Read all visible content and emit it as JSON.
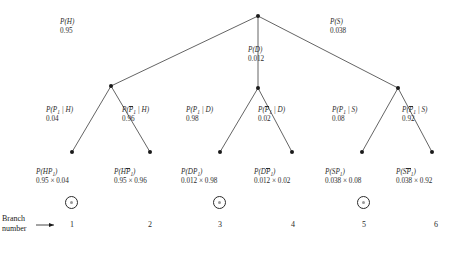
{
  "figure": {
    "type": "probability-tree-diagram",
    "caption": "",
    "branch_caption_line1": "Branch",
    "branch_caption_line2": "number"
  },
  "nodes": {
    "root": {
      "x": 258,
      "y": 16
    },
    "level1": [
      {
        "id": "H",
        "x": 111,
        "y": 86
      },
      {
        "id": "D",
        "x": 258,
        "y": 88
      },
      {
        "id": "S",
        "x": 398,
        "y": 88
      }
    ],
    "leaves": [
      {
        "x": 72,
        "y": 152
      },
      {
        "x": 150,
        "y": 152
      },
      {
        "x": 220,
        "y": 152
      },
      {
        "x": 292,
        "y": 152
      },
      {
        "x": 362,
        "y": 152
      },
      {
        "x": 432,
        "y": 152
      }
    ]
  },
  "level1_labels": [
    {
      "name": "P(H)",
      "symbol_html": "P(H)",
      "value": "0.95",
      "x": 60,
      "y": 18
    },
    {
      "name": "P(D)",
      "symbol_html": "P(D)",
      "value": "0.012",
      "x": 248,
      "y": 46
    },
    {
      "name": "P(S)",
      "symbol_html": "P(S)",
      "value": "0.038",
      "x": 330,
      "y": 18
    }
  ],
  "level2_labels": [
    {
      "name": "P(P1|H)",
      "value": "0.04",
      "x": 46,
      "y": 106
    },
    {
      "name": "P(P1bar|H)",
      "value": "0.96",
      "x": 122,
      "y": 106
    },
    {
      "name": "P(P1|D)",
      "value": "0.98",
      "x": 186,
      "y": 106
    },
    {
      "name": "P(P1bar|D)",
      "value": "0.02",
      "x": 258,
      "y": 106
    },
    {
      "name": "P(P1|S)",
      "value": "0.08",
      "x": 332,
      "y": 106
    },
    {
      "name": "P(P1bar|S)",
      "value": "0.92",
      "x": 402,
      "y": 106
    }
  ],
  "leaf_labels": [
    {
      "name": "P(HP1)",
      "value": "0.95 × 0.04",
      "x": 36,
      "y": 168
    },
    {
      "name": "P(HP1bar)",
      "value": "0.95 × 0.96",
      "x": 114,
      "y": 168
    },
    {
      "name": "P(DP1)",
      "value": "0.012 × 0.98",
      "x": 181,
      "y": 168
    },
    {
      "name": "P(DP1bar)",
      "value": "0.012 × 0.02",
      "x": 254,
      "y": 168
    },
    {
      "name": "P(SP1)",
      "value": "0.038 × 0.08",
      "x": 325,
      "y": 168
    },
    {
      "name": "P(SP1bar)",
      "value": "0.038 × 0.92",
      "x": 396,
      "y": 168
    }
  ],
  "branch_numbers": [
    {
      "label": "1",
      "x": 60
    },
    {
      "label": "2",
      "x": 138
    },
    {
      "label": "3",
      "x": 208
    },
    {
      "label": "4",
      "x": 281
    },
    {
      "label": "5",
      "x": 352
    },
    {
      "label": "6",
      "x": 424
    }
  ],
  "markers": [
    {
      "for_branch": "1",
      "x": 65
    },
    {
      "for_branch": "3",
      "x": 213
    },
    {
      "for_branch": "5",
      "x": 357
    }
  ],
  "colors": {
    "ink": "#2b2b2b",
    "line": "#3c3c3c",
    "background": "#ffffff"
  }
}
